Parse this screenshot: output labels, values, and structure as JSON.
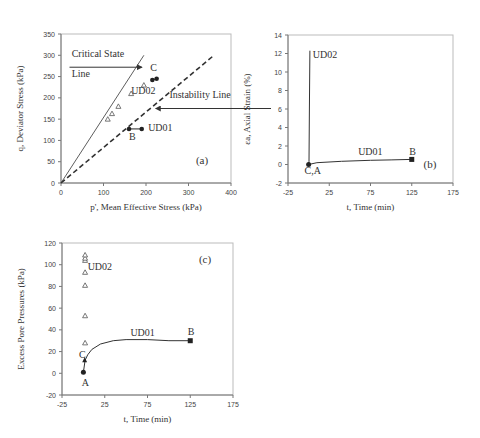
{
  "chart_data": [
    {
      "id": "a",
      "type": "scatter",
      "panel_label": "(a)",
      "xlabel": "p', Mean Effective Stress (kPa)",
      "ylabel": "q, Deviator Stress (kPa)",
      "xlim": [
        0,
        400
      ],
      "ylim": [
        0,
        350
      ],
      "xticks": [
        0,
        100,
        200,
        300,
        400
      ],
      "yticks": [
        0,
        50,
        100,
        150,
        200,
        250,
        300,
        350
      ],
      "grid": false,
      "lines": [
        {
          "name": "Critical State Line",
          "style": "solid",
          "points": [
            [
              0,
              0
            ],
            [
              195,
              300
            ]
          ]
        },
        {
          "name": "Instability Line",
          "style": "dashed",
          "points": [
            [
              0,
              0
            ],
            [
              360,
              300
            ]
          ]
        }
      ],
      "series": [
        {
          "name": "UD02",
          "marker": "triangle-open",
          "x": [
            110,
            120,
            135,
            165,
            195
          ],
          "y": [
            150,
            163,
            180,
            210,
            230
          ]
        },
        {
          "name": "UD01",
          "marker": "circle-filled",
          "x": [
            160,
            190
          ],
          "y": [
            127,
            127
          ]
        },
        {
          "name": "UD02 end",
          "marker": "circle-filled",
          "x": [
            215,
            225
          ],
          "y": [
            242,
            245
          ]
        }
      ],
      "annotations": [
        {
          "text": "Critical State",
          "x": 25,
          "y": 295
        },
        {
          "text": "Line",
          "x": 25,
          "y": 250
        },
        {
          "text": "Instability Line",
          "x": 255,
          "y": 200
        },
        {
          "text": "C",
          "x": 210,
          "y": 262
        },
        {
          "text": "UD02",
          "x": 165,
          "y": 210
        },
        {
          "text": "UD01",
          "x": 205,
          "y": 122
        },
        {
          "text": "B",
          "x": 160,
          "y": 100
        }
      ]
    },
    {
      "id": "b",
      "type": "line",
      "panel_label": "(b)",
      "xlabel": "t, Time (min)",
      "ylabel": "εa, Axial Strain (%)",
      "xlim": [
        -25,
        175
      ],
      "ylim": [
        -2,
        14
      ],
      "xticks": [
        -25,
        25,
        75,
        125,
        175
      ],
      "yticks": [
        -2,
        0,
        2,
        4,
        6,
        8,
        10,
        12,
        14
      ],
      "grid": false,
      "series": [
        {
          "name": "UD02",
          "x": [
            0,
            0.5,
            1,
            1.5
          ],
          "y": [
            0,
            0.3,
            6,
            12.3
          ]
        },
        {
          "name": "UD01",
          "x": [
            0,
            10,
            40,
            75,
            100,
            125
          ],
          "y": [
            0,
            0.2,
            0.35,
            0.45,
            0.5,
            0.55
          ]
        }
      ],
      "annotations": [
        {
          "text": "UD02",
          "x": 5,
          "y": 11.5
        },
        {
          "text": "UD01",
          "x": 60,
          "y": 1.0
        },
        {
          "text": "B",
          "x": 122,
          "y": 1.0
        },
        {
          "text": "C,A",
          "x": -5,
          "y": -1.0
        }
      ]
    },
    {
      "id": "c",
      "type": "scatter",
      "panel_label": "(c)",
      "xlabel": "t, Time (min)",
      "ylabel": "Excess Pore Pressures (kPa)",
      "xlim": [
        -25,
        175
      ],
      "ylim": [
        -20,
        120
      ],
      "xticks": [
        -25,
        25,
        75,
        125,
        175
      ],
      "yticks": [
        -20,
        0,
        20,
        40,
        60,
        80,
        100,
        120
      ],
      "grid": false,
      "series": [
        {
          "name": "UD02",
          "marker": "triangle-open",
          "x": [
            2,
            2,
            2,
            2,
            2,
            2,
            2
          ],
          "y": [
            28,
            53,
            81,
            93,
            104,
            106,
            109
          ]
        },
        {
          "name": "UD01",
          "marker": "line",
          "x": [
            0,
            2,
            5,
            10,
            20,
            35,
            50,
            75,
            100,
            125
          ],
          "y": [
            1,
            12,
            17,
            22,
            27,
            30,
            31,
            31,
            30,
            30
          ]
        }
      ],
      "annotations": [
        {
          "text": "UD02",
          "x": 5,
          "y": 95
        },
        {
          "text": "UD01",
          "x": 55,
          "y": 34
        },
        {
          "text": "B",
          "x": 122,
          "y": 35
        },
        {
          "text": "C",
          "x": -5,
          "y": 14
        },
        {
          "text": "A",
          "x": -2,
          "y": -12
        }
      ]
    }
  ]
}
